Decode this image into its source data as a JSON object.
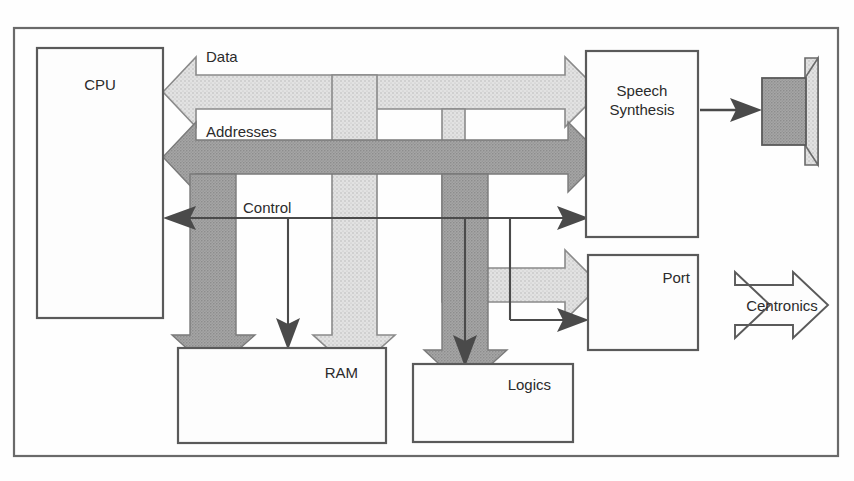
{
  "diagram": {
    "blocks": [
      {
        "id": "cpu",
        "label": "CPU"
      },
      {
        "id": "ram",
        "label": "RAM"
      },
      {
        "id": "logics",
        "label": "Logics"
      },
      {
        "id": "speech",
        "label_line1": "Speech",
        "label_line2": "Synthesis"
      },
      {
        "id": "port",
        "label": "Port"
      }
    ],
    "buses": [
      {
        "id": "data",
        "label": "Data",
        "color": "#d8d8d8",
        "style": "hollow-light"
      },
      {
        "id": "addresses",
        "label": "Addresses",
        "color": "#9a9a9a",
        "style": "solid-gray"
      },
      {
        "id": "control",
        "label": "Control",
        "color": "#4a4a4a",
        "style": "thin-line"
      }
    ],
    "connectors": [
      {
        "id": "centronics",
        "label": "Centronics",
        "kind": "double-headed-arrow"
      },
      {
        "id": "speaker-link",
        "label": "",
        "kind": "arrow"
      }
    ],
    "peripherals": [
      {
        "id": "speaker",
        "label": ""
      }
    ],
    "colors": {
      "data_bus": "#d8d8d8",
      "address_bus": "#9a9a9a",
      "control_bus": "#4a4a4a",
      "box_stroke": "#5a5a5a",
      "frame_stroke": "#6a6a6a",
      "text": "#2b2b2b",
      "speaker_body": "#9a9a9a",
      "speaker_cone": "#dcdcdc",
      "background": "#fefefe"
    }
  }
}
